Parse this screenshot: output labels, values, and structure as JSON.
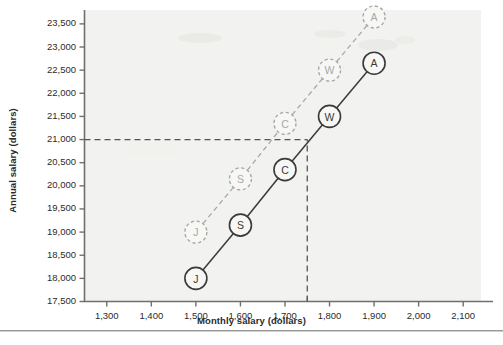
{
  "chart_data": {
    "type": "line",
    "title": "",
    "subtitle": "",
    "xlabel": "Monthly salary (dollars)",
    "ylabel": "Annual salary (dollars)",
    "xlim": [
      1250,
      2140
    ],
    "ylim": [
      17500,
      23800
    ],
    "grid": false,
    "legend_position": "none",
    "x": [
      1500,
      1600,
      1700,
      1800,
      1900
    ],
    "xtick_labels": [
      "1,300",
      "1,400",
      "1,500",
      "1,600",
      "1,700",
      "1,800",
      "1,900",
      "2,000",
      "2,100"
    ],
    "xtick_values": [
      1300,
      1400,
      1500,
      1600,
      1700,
      1800,
      1900,
      2000,
      2100
    ],
    "ytick_labels": [
      "17,500",
      "18,000",
      "18,500",
      "19,000",
      "19,500",
      "20,000",
      "20,500",
      "21,000",
      "21,500",
      "22,000",
      "22,500",
      "23,000",
      "23,500"
    ],
    "ytick_values": [
      17500,
      18000,
      18500,
      19000,
      19500,
      20000,
      20500,
      21000,
      21500,
      22000,
      22500,
      23000,
      23500
    ],
    "series": [
      {
        "name": "solid-series",
        "style": "solid",
        "color": "#3a3a3a",
        "marker": "labeled-circle-filled-outline",
        "values": [
          18000,
          19150,
          20350,
          21500,
          22650
        ],
        "point_labels": [
          "J",
          "S",
          "C",
          "W",
          "A"
        ]
      },
      {
        "name": "dashed-series",
        "style": "dashed",
        "color": "#a8a8a8",
        "marker": "labeled-circle-dashed-outline",
        "values": [
          19000,
          20150,
          21350,
          22500,
          23650
        ],
        "point_labels": [
          "J",
          "S",
          "C",
          "W",
          "A"
        ]
      }
    ],
    "annotations": [
      {
        "name": "horizontal-reference-line",
        "type": "hline",
        "value": 21000,
        "x_from": 1250,
        "x_to": 1750,
        "style": "dashed",
        "color": "#555555"
      },
      {
        "name": "vertical-reference-line",
        "type": "vline",
        "value": 1750,
        "y_from": 17500,
        "y_to": 21000,
        "style": "dashed",
        "color": "#555555"
      }
    ]
  },
  "axes": {
    "x_title": "Monthly salary (dollars)",
    "y_title": "Annual salary (dollars)"
  }
}
